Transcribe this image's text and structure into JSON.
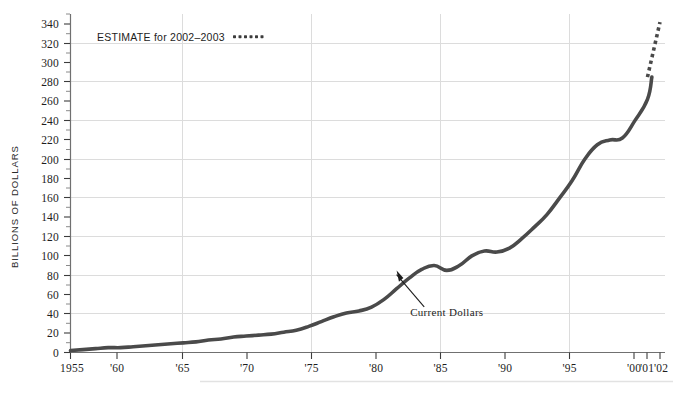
{
  "chart_data": {
    "type": "line",
    "title": "",
    "xlabel": "",
    "ylabel": "BILLIONS OF DOLLARS",
    "xlim": [
      1955,
      2003
    ],
    "ylim": [
      0,
      345
    ],
    "grid": "both",
    "y_ticks": [
      0,
      20,
      40,
      60,
      80,
      100,
      120,
      140,
      160,
      180,
      200,
      220,
      240,
      260,
      280,
      300,
      320,
      340
    ],
    "y_tick_labels": [
      "0",
      "20",
      "40",
      "60",
      "80",
      "100",
      "120",
      "140",
      "160",
      "180",
      "200",
      "220",
      "240",
      "260",
      "280",
      "300",
      "320",
      "340"
    ],
    "y_gridline_values": [
      40,
      80,
      120,
      160,
      200,
      240,
      280,
      320
    ],
    "x_ticks": [
      1955,
      1960,
      1965,
      1970,
      1975,
      1980,
      1985,
      1990,
      1995,
      2000,
      2001,
      2002
    ],
    "x_tick_labels": [
      "1955",
      "'60",
      "'65",
      "'70",
      "'75",
      "'80",
      "'85",
      "'90",
      "'95",
      "'00",
      "'01",
      "'02"
    ],
    "x_gridline_values": [
      1965,
      1975,
      1985,
      1995
    ],
    "legend_position": "top-left",
    "series": [
      {
        "name": "Current Dollars",
        "style": "solid",
        "color": "#4a4a4a",
        "x": [
          1955,
          1956,
          1957,
          1958,
          1959,
          1960,
          1961,
          1962,
          1963,
          1964,
          1965,
          1966,
          1967,
          1968,
          1969,
          1970,
          1971,
          1972,
          1973,
          1974,
          1975,
          1976,
          1977,
          1978,
          1979,
          1980,
          1981,
          1982,
          1983,
          1984,
          1985,
          1986,
          1987,
          1988,
          1989,
          1990,
          1991,
          1992,
          1993,
          1994,
          1995,
          1996,
          1997,
          1998,
          1999,
          2000,
          2001
        ],
        "values": [
          2,
          3,
          4,
          5,
          5,
          6,
          7,
          8,
          9,
          10,
          11,
          13,
          14,
          16,
          17,
          18,
          19,
          21,
          23,
          27,
          32,
          37,
          41,
          43,
          47,
          55,
          66,
          77,
          86,
          90,
          85,
          90,
          100,
          105,
          104,
          108,
          118,
          130,
          143,
          160,
          178,
          200,
          215,
          220,
          222,
          240,
          262
        ],
        "solid_end_x": 2001,
        "solid_end_value": 285
      },
      {
        "name": "ESTIMATE for 2002-2003",
        "style": "dotted",
        "color": "#4a4a4a",
        "x": [
          2001,
          2002
        ],
        "values": [
          285,
          342
        ]
      }
    ],
    "annotations": [
      {
        "text": "Current Dollars",
        "target_x": 1981,
        "target_y": 90,
        "label_x": 1983.2,
        "label_y": 38
      }
    ],
    "legend": {
      "label": "ESTIMATE for 2002–2003",
      "swatch": "dotted-line-swatch"
    }
  },
  "axis": {
    "y_title": "BILLIONS OF DOLLARS"
  },
  "colors": {
    "line": "#4a4a4a",
    "grid": "#dadada",
    "axis": "#6a6a6a",
    "text": "#1d1d1d",
    "footer_rule": "#e2e2e2"
  }
}
